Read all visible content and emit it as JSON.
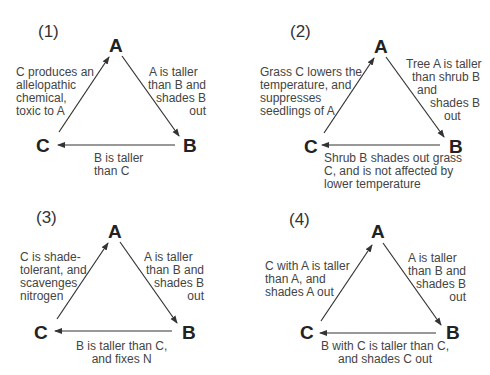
{
  "panels": [
    {
      "number": "(1)",
      "nodes": {
        "A": "A",
        "B": "B",
        "C": "C"
      },
      "edges": {
        "C_to_A": [
          "C produces an",
          "allelopathic",
          "chemical,",
          "toxic to A"
        ],
        "A_to_B": [
          "A is taller",
          "than B and",
          "shades B",
          "out"
        ],
        "B_to_C": [
          "B is taller",
          "than C"
        ]
      }
    },
    {
      "number": "(2)",
      "nodes": {
        "A": "A",
        "B": "B",
        "C": "C"
      },
      "edges": {
        "C_to_A": [
          "Grass C lowers the",
          "temperature, and",
          "suppresses",
          "seedlings of A"
        ],
        "A_to_B": [
          "Tree A is taller",
          "than shrub B",
          "and",
          "shades B",
          "out"
        ],
        "B_to_C": [
          "Shrub B shades out grass",
          "C, and is not affected by",
          "lower temperature"
        ]
      }
    },
    {
      "number": "(3)",
      "nodes": {
        "A": "A",
        "B": "B",
        "C": "C"
      },
      "edges": {
        "C_to_A": [
          "C is shade-",
          "tolerant, and",
          "scavenges",
          "nitrogen"
        ],
        "A_to_B": [
          "A is taller",
          "than B and",
          "shades B",
          "out"
        ],
        "B_to_C": [
          "B is taller than C,",
          "and fixes N"
        ]
      }
    },
    {
      "number": "(4)",
      "nodes": {
        "A": "A",
        "B": "B",
        "C": "C"
      },
      "edges": {
        "C_to_A": [
          "C with A is taller",
          "than A, and",
          "shades A out"
        ],
        "A_to_B": [
          "A is taller",
          "than B and",
          "shades B",
          "out"
        ],
        "B_to_C": [
          "B with C is taller than C,",
          "and shades C out"
        ]
      }
    }
  ],
  "colors": {
    "arrow": "#333333",
    "text": "#444444"
  }
}
